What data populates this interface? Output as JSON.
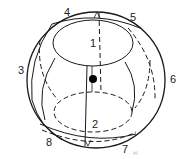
{
  "diagram": {
    "type": "sphere-segmentation",
    "regions": [
      {
        "id": "region-1",
        "label": "1"
      },
      {
        "id": "region-2",
        "label": "2"
      },
      {
        "id": "region-3",
        "label": "3"
      },
      {
        "id": "region-4",
        "label": "4"
      },
      {
        "id": "region-5",
        "label": "5"
      },
      {
        "id": "region-6",
        "label": "6"
      },
      {
        "id": "region-7",
        "label": "7"
      },
      {
        "id": "region-8",
        "label": "8"
      }
    ],
    "caption_mark": "(a)",
    "colors": {
      "stroke": "#1a1a1a",
      "dot": "#000000",
      "background": "#ffffff"
    }
  }
}
